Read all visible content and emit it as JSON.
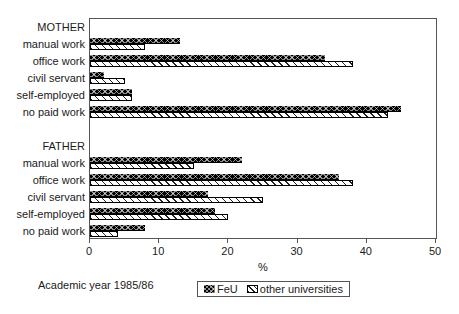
{
  "figure": {
    "background": "#ffffff",
    "caption": "Academic year 1985/86"
  },
  "chart_data": {
    "type": "bar",
    "orientation": "horizontal",
    "title": "",
    "xlabel": "%",
    "xlim": [
      0,
      50
    ],
    "xticks": [
      0,
      10,
      20,
      30,
      40,
      50
    ],
    "grid": false,
    "legend_position": "bottom-center",
    "series_names": [
      "FeU",
      "other universities"
    ],
    "caption": "Academic year 1985/86",
    "groups": [
      {
        "label": "MOTHER",
        "categories": [
          "manual work",
          "office work",
          "civil servant",
          "self-employed",
          "no paid work"
        ],
        "series": [
          {
            "name": "FeU",
            "values": [
              13,
              34,
              2,
              6,
              45
            ]
          },
          {
            "name": "other universities",
            "values": [
              8,
              38,
              5,
              6,
              43
            ]
          }
        ]
      },
      {
        "label": "FATHER",
        "categories": [
          "manual work",
          "office work",
          "civil servant",
          "self-employed",
          "no paid work"
        ],
        "series": [
          {
            "name": "FeU",
            "values": [
              22,
              36,
              17,
              18,
              8
            ]
          },
          {
            "name": "other universities",
            "values": [
              15,
              38,
              25,
              20,
              4
            ]
          }
        ]
      }
    ],
    "colors": {
      "feu_fill": "#000000",
      "other_fill": "#ffffff",
      "hatch_line": "#000000",
      "axis": "#555555",
      "text": "#1a1a1a"
    }
  }
}
